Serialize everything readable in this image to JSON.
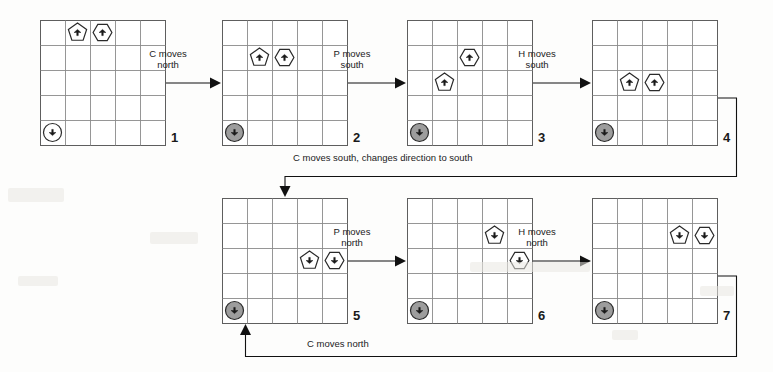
{
  "figure": {
    "kind": "state-transition-diagram",
    "grid": {
      "rows": 5,
      "cols": 5,
      "cell_px": 25,
      "line_color": "#8a8a8a",
      "border_color": "#5e5e5e"
    },
    "agent_types": {
      "C": {
        "shape": "circle",
        "label": "C",
        "icon": "circle-agent-icon",
        "fill": "#9a9a9a"
      },
      "P": {
        "shape": "pentagon",
        "label": "P",
        "icon": "pentagon-agent-icon",
        "fill": "#ffffff"
      },
      "H": {
        "shape": "hexagon",
        "label": "H",
        "icon": "hexagon-agent-icon",
        "fill": "#ffffff"
      }
    }
  },
  "panels": [
    {
      "number": "1",
      "x": 40,
      "y": 20,
      "agents": [
        {
          "type": "P",
          "row": 1,
          "col": 2,
          "heading": "north"
        },
        {
          "type": "H",
          "row": 1,
          "col": 3,
          "heading": "north"
        },
        {
          "type": "C",
          "row": 5,
          "col": 1,
          "heading": "south",
          "shaded": false
        }
      ]
    },
    {
      "number": "2",
      "x": 222,
      "y": 20,
      "agents": [
        {
          "type": "P",
          "row": 2,
          "col": 2,
          "heading": "north"
        },
        {
          "type": "H",
          "row": 2,
          "col": 3,
          "heading": "north"
        },
        {
          "type": "C",
          "row": 5,
          "col": 1,
          "heading": "south",
          "shaded": true
        }
      ]
    },
    {
      "number": "3",
      "x": 407,
      "y": 20,
      "agents": [
        {
          "type": "H",
          "row": 2,
          "col": 3,
          "heading": "north"
        },
        {
          "type": "P",
          "row": 3,
          "col": 2,
          "heading": "north"
        },
        {
          "type": "C",
          "row": 5,
          "col": 1,
          "heading": "south",
          "shaded": true
        }
      ]
    },
    {
      "number": "4",
      "x": 592,
      "y": 20,
      "agents": [
        {
          "type": "P",
          "row": 3,
          "col": 2,
          "heading": "north"
        },
        {
          "type": "H",
          "row": 3,
          "col": 3,
          "heading": "north"
        },
        {
          "type": "C",
          "row": 5,
          "col": 1,
          "heading": "south",
          "shaded": true
        }
      ]
    },
    {
      "number": "5",
      "x": 222,
      "y": 198,
      "agents": [
        {
          "type": "P",
          "row": 3,
          "col": 4,
          "heading": "south"
        },
        {
          "type": "H",
          "row": 3,
          "col": 5,
          "heading": "south"
        },
        {
          "type": "C",
          "row": 5,
          "col": 1,
          "heading": "south",
          "shaded": true
        }
      ]
    },
    {
      "number": "6",
      "x": 407,
      "y": 198,
      "agents": [
        {
          "type": "P",
          "row": 2,
          "col": 4,
          "heading": "south"
        },
        {
          "type": "H",
          "row": 3,
          "col": 5,
          "heading": "south"
        },
        {
          "type": "C",
          "row": 5,
          "col": 1,
          "heading": "south",
          "shaded": true
        }
      ]
    },
    {
      "number": "7",
      "x": 592,
      "y": 198,
      "agents": [
        {
          "type": "P",
          "row": 2,
          "col": 4,
          "heading": "south"
        },
        {
          "type": "H",
          "row": 2,
          "col": 5,
          "heading": "south"
        },
        {
          "type": "C",
          "row": 5,
          "col": 1,
          "heading": "south",
          "shaded": true
        }
      ]
    }
  ],
  "transitions": [
    {
      "id": "t1",
      "label": "C moves\nnorth",
      "from": "1",
      "to": "2",
      "style": "straight-right",
      "label_x": 168,
      "label_y": 48
    },
    {
      "id": "t2",
      "label": "P moves\nsouth",
      "from": "2",
      "to": "3",
      "style": "straight-right",
      "label_x": 352,
      "label_y": 48
    },
    {
      "id": "t3",
      "label": "H moves\nsouth",
      "from": "3",
      "to": "4",
      "style": "straight-right",
      "label_x": 537,
      "label_y": 48
    },
    {
      "id": "t4",
      "label": "C moves south, changes direction to south",
      "from": "4",
      "to": "5",
      "style": "routed-down",
      "label_x": 293,
      "label_y": 152
    },
    {
      "id": "t5",
      "label": "P moves\nnorth",
      "from": "5",
      "to": "6",
      "style": "straight-right",
      "label_x": 352,
      "label_y": 226
    },
    {
      "id": "t6",
      "label": "H moves\nnorth",
      "from": "6",
      "to": "7",
      "style": "straight-right",
      "label_x": 537,
      "label_y": 226
    },
    {
      "id": "t7",
      "label": "C moves north",
      "from": "7",
      "to": "5",
      "style": "routed-up",
      "label_x": 307,
      "label_y": 338
    }
  ],
  "colors": {
    "ink": "#1b1b1b",
    "grid_line": "#8a8a8a",
    "grid_border": "#5e5e5e",
    "arrow": "#111111",
    "circle_shaded": "#9d9d9d",
    "paper": "#fdfdfc"
  }
}
